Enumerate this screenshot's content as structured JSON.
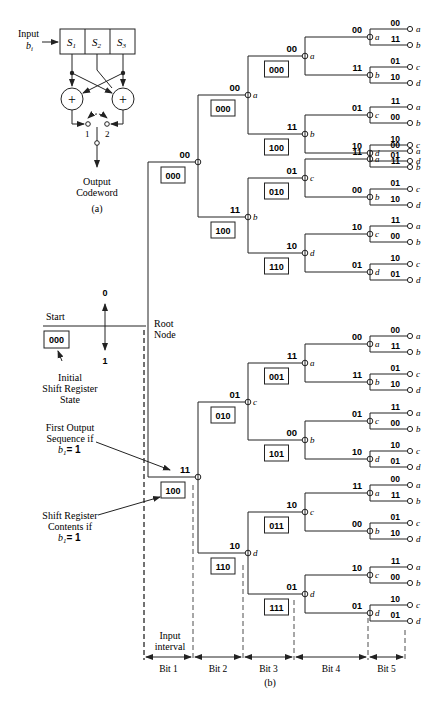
{
  "encoder": {
    "input_label": "Input",
    "input_var": "b",
    "input_sub": "i",
    "registers": [
      "S",
      "S",
      "S"
    ],
    "register_subs": [
      "1",
      "2",
      "3"
    ],
    "adder_symbol": "+",
    "switch_labels": [
      "1",
      "2"
    ],
    "output_label_1": "Output",
    "output_label_2": "Codeword",
    "caption": "(a)"
  },
  "tree": {
    "start_label": "Start",
    "start_state": "000",
    "initial_label_1": "Initial",
    "initial_label_2": "Shift Register",
    "initial_label_3": "State",
    "root_label_1": "Root",
    "root_label_2": "Node",
    "up_label": "0",
    "down_label": "1",
    "first_output_1": "First Output",
    "first_output_2": "Sequence if",
    "first_output_3": "b",
    "first_output_sub": "1",
    "first_output_eq": "= 1",
    "shift_contents_1": "Shift Register",
    "shift_contents_2": "Contents if",
    "shift_contents_3": "b",
    "shift_contents_sub": "1",
    "shift_contents_eq": "= 1",
    "input_interval_1": "Input",
    "input_interval_2": "interval",
    "bits": [
      "Bit 1",
      "Bit 2",
      "Bit 3",
      "Bit 4",
      "Bit 5"
    ],
    "caption": "(b)",
    "level1": [
      {
        "output": "00",
        "state": "000",
        "node": ""
      },
      {
        "output": "11",
        "state": "100",
        "node": ""
      }
    ],
    "level2": [
      {
        "output": "00",
        "state": "000",
        "node": "a"
      },
      {
        "output": "11",
        "state": "100",
        "node": "b"
      },
      {
        "output": "01",
        "state": "010",
        "node": "c"
      },
      {
        "output": "10",
        "state": "110",
        "node": "d"
      }
    ],
    "level3": [
      {
        "output": "00",
        "state": "000",
        "node": "a"
      },
      {
        "output": "11",
        "state": "100",
        "node": "b"
      },
      {
        "output": "01",
        "state": "010",
        "node": "c"
      },
      {
        "output": "10",
        "state": "110",
        "node": "d"
      },
      {
        "output": "11",
        "state": "001",
        "node": "a"
      },
      {
        "output": "00",
        "state": "101",
        "node": "b"
      },
      {
        "output": "10",
        "state": "011",
        "node": "c"
      },
      {
        "output": "01",
        "state": "111",
        "node": "d"
      }
    ],
    "level4": [
      {
        "output": "00",
        "state": "000",
        "node": "a"
      },
      {
        "output": "11",
        "state": "100",
        "node": "b"
      },
      {
        "output": "01",
        "state": "010",
        "node": "c"
      },
      {
        "output": "10",
        "state": "110",
        "node": "d"
      },
      {
        "output": "11",
        "state": "001",
        "node": "a"
      },
      {
        "output": "00",
        "state": "101",
        "node": "b"
      },
      {
        "output": "10",
        "state": "011",
        "node": "c"
      },
      {
        "output": "01",
        "state": "111",
        "node": "d"
      },
      {
        "output": "00",
        "state": "000",
        "node": "a"
      },
      {
        "output": "11",
        "state": "100",
        "node": "b"
      },
      {
        "output": "01",
        "state": "010",
        "node": "c"
      },
      {
        "output": "10",
        "state": "110",
        "node": "d"
      },
      {
        "output": "11",
        "state": "001",
        "node": "a"
      },
      {
        "output": "00",
        "state": "101",
        "node": "b"
      },
      {
        "output": "10",
        "state": "011",
        "node": "c"
      },
      {
        "output": "01",
        "state": "111",
        "node": "d"
      }
    ],
    "leaf_outputs": [
      "00",
      "11",
      "01",
      "10",
      "11",
      "00",
      "10",
      "01"
    ],
    "leaf_nodes": [
      "a",
      "b",
      "c",
      "d"
    ]
  },
  "figure_caption": "Figure 6.xx  Tree diagram (b) for convolutional encoder (a)."
}
